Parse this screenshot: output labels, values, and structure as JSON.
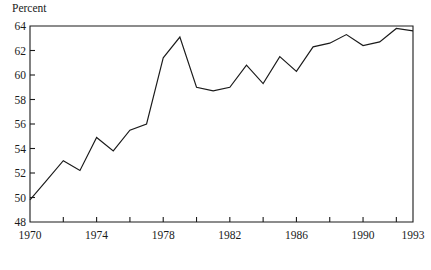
{
  "chart_data": {
    "type": "line",
    "title": "",
    "subtitle": "",
    "ylabel": "Percent",
    "xlabel": "",
    "xlim": [
      1970,
      1993
    ],
    "ylim": [
      48,
      64
    ],
    "grid": false,
    "legend": null,
    "yticks": [
      48,
      50,
      52,
      54,
      56,
      58,
      60,
      62,
      64
    ],
    "ytick_labels": [
      "48",
      "50",
      "52",
      "54",
      "56",
      "58",
      "60",
      "62",
      "64"
    ],
    "xticks": [
      1970,
      1972,
      1974,
      1976,
      1978,
      1980,
      1982,
      1984,
      1986,
      1988,
      1990,
      1992,
      1993
    ],
    "xtick_labels": [
      "1970",
      "",
      "1974",
      "",
      "1978",
      "",
      "1982",
      "",
      "1986",
      "",
      "1990",
      "",
      "1993"
    ],
    "x": [
      1970,
      1971,
      1972,
      1973,
      1974,
      1975,
      1976,
      1977,
      1978,
      1979,
      1980,
      1981,
      1982,
      1983,
      1984,
      1985,
      1986,
      1987,
      1988,
      1989,
      1990,
      1991,
      1992,
      1993
    ],
    "values": [
      49.8,
      51.4,
      53.0,
      52.2,
      54.9,
      53.8,
      55.5,
      56.0,
      61.4,
      63.1,
      59.0,
      58.7,
      59.0,
      60.8,
      59.3,
      61.5,
      60.3,
      62.3,
      62.6,
      63.3,
      62.4,
      62.7,
      63.8,
      63.6
    ],
    "series": [
      {
        "name": "Percent",
        "color": "#1a1a1a",
        "values": [
          49.8,
          51.4,
          53.0,
          52.2,
          54.9,
          53.8,
          55.5,
          56.0,
          61.4,
          63.1,
          59.0,
          58.7,
          59.0,
          60.8,
          59.3,
          61.5,
          60.3,
          62.3,
          62.6,
          63.3,
          62.4,
          62.7,
          63.8,
          63.6
        ]
      }
    ]
  },
  "layout": {
    "plot_left": 30,
    "plot_right": 413,
    "plot_top": 26,
    "plot_bottom": 222,
    "axis_color": "#1a1a1a"
  }
}
